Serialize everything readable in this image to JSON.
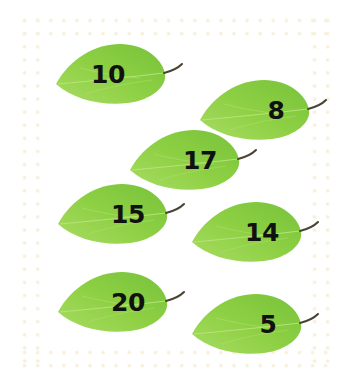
{
  "worksheet": {
    "background_color": "#ffffff",
    "border": {
      "name": "dotted-cream-border",
      "dot_color": "#f7efd8",
      "dot_spacing_px": 13
    },
    "leaf": {
      "body_color_light": "#a4da5c",
      "body_color_mid": "#8ccf42",
      "body_color_dark": "#79c43c",
      "vein_color": "#b6e27a",
      "stem_color": "#4a4334",
      "number_color": "#111111"
    },
    "leaves": [
      {
        "label": "10",
        "value": 10
      },
      {
        "label": "8",
        "value": 8
      },
      {
        "label": "17",
        "value": 17
      },
      {
        "label": "15",
        "value": 15
      },
      {
        "label": "14",
        "value": 14
      },
      {
        "label": "20",
        "value": 20
      },
      {
        "label": "5",
        "value": 5
      }
    ]
  }
}
